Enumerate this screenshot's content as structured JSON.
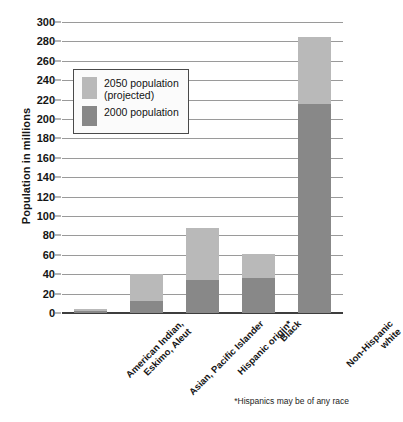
{
  "chart_data": {
    "type": "bar",
    "title": "",
    "xlabel": "",
    "ylabel": "Population in millions",
    "ylim": [
      0,
      300
    ],
    "ytick_step": 20,
    "grid": true,
    "stacked": true,
    "legend_position": "upper-left-inside",
    "categories": [
      "American Indian,\nEskimo, Aleut",
      "Asian, Pacific Islander",
      "Hispanic origin*",
      "Black",
      "Non-Hispanic\nwhite"
    ],
    "yticks": [
      0,
      20,
      40,
      60,
      80,
      100,
      120,
      140,
      160,
      180,
      200,
      220,
      240,
      260,
      280,
      300
    ],
    "series": [
      {
        "name": "2000 population",
        "color": "#888888",
        "values": [
          2,
          12,
          34,
          36,
          215
        ]
      },
      {
        "name": "2050 population (projected)",
        "color": "#b9b9b9",
        "values": [
          4,
          40,
          88,
          61,
          285
        ]
      }
    ],
    "annotations": [
      "*Hispanics may be of any race"
    ]
  },
  "axis": {
    "y_title": "Population in millions",
    "tick_labels": [
      "300",
      "280",
      "260",
      "240",
      "220",
      "200",
      "180",
      "160",
      "140",
      "120",
      "100",
      "80",
      "60",
      "40",
      "20",
      "0"
    ]
  },
  "legend": {
    "items": [
      {
        "label": "2050 population\n(projected)",
        "color": "#b9b9b9"
      },
      {
        "label": "2000 population",
        "color": "#888888"
      }
    ]
  },
  "footnote": {
    "text": "*Hispanics may be of any race"
  },
  "colors": {
    "projected": "#b9b9b9",
    "current": "#888888",
    "gridline": "#9a9a9a",
    "axis": "#3d3d3d",
    "background": "#ffffff"
  }
}
